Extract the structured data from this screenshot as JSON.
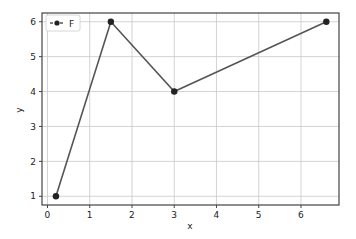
{
  "chart_data": {
    "type": "line",
    "title": "",
    "xlabel": "x",
    "ylabel": "y",
    "xlim": [
      -0.13,
      6.9
    ],
    "ylim": [
      0.75,
      6.25
    ],
    "xticks": [
      0,
      1,
      2,
      3,
      4,
      5,
      6
    ],
    "yticks": [
      1,
      2,
      3,
      4,
      5,
      6
    ],
    "grid": true,
    "legend_position": "upper left",
    "series": [
      {
        "name": "F",
        "x": [
          0.2,
          1.5,
          3.0,
          6.6
        ],
        "y": [
          1,
          6,
          4,
          6
        ],
        "color": "#555555",
        "marker": "circle",
        "linestyle": "solid"
      }
    ]
  },
  "legend": {
    "label": "F"
  },
  "axes": {
    "xlabel": "x",
    "ylabel": "y"
  },
  "colors": {
    "line": "#555555",
    "marker": "#222222",
    "grid": "#c8c8c8",
    "frame": "#444444"
  }
}
